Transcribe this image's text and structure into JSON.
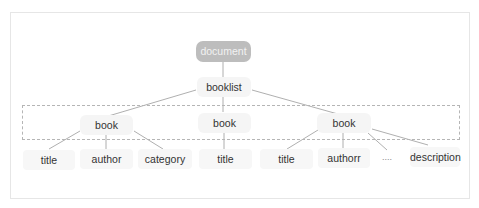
{
  "diagram": {
    "type": "tree",
    "root": {
      "id": "document",
      "label": "document"
    },
    "level1": {
      "id": "booklist",
      "label": "booklist"
    },
    "books": [
      {
        "id": "book1",
        "label": "book",
        "children": [
          "title",
          "author",
          "category"
        ]
      },
      {
        "id": "book2",
        "label": "book",
        "children": [
          "title"
        ]
      },
      {
        "id": "book3",
        "label": "book",
        "children": [
          "title",
          "authorr",
          "....",
          "description"
        ]
      }
    ],
    "leaves": {
      "b1_title": "title",
      "b1_author": "author",
      "b1_category": "category",
      "b2_title": "title",
      "b3_title": "title",
      "b3_author": "authorr",
      "b3_ellipsis": "....",
      "b3_description": "description"
    },
    "highlight_group": "book level (dashed box)",
    "colors": {
      "root_fill": "#bdbdbd",
      "node_fill": "#f5f5f5",
      "edge": "#9a9a9a",
      "dash": "#b5b5b5"
    }
  }
}
